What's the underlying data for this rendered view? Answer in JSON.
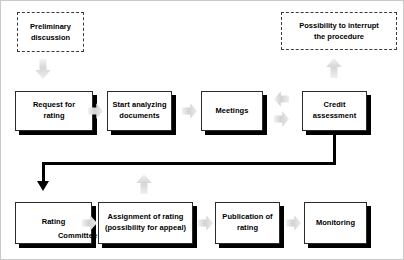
{
  "diagram": {
    "accent_color": "#000000",
    "arrow_color": "#d2d2d2",
    "nodes": [
      {
        "id": "preliminary-discussion",
        "label": "Preliminary discussion",
        "style": "dashed"
      },
      {
        "id": "possibility-to-interrupt",
        "label": "Possibility to interrupt the procedure",
        "style": "dashed"
      },
      {
        "id": "request-for-rating",
        "label": "Request for rating",
        "style": "solid"
      },
      {
        "id": "start-analyzing-documents",
        "label": "Start analyzing documents",
        "style": "solid"
      },
      {
        "id": "meetings",
        "label": "Meetings",
        "style": "solid"
      },
      {
        "id": "credit-assessment",
        "label": "Credit assessment",
        "style": "solid"
      },
      {
        "id": "rating-committee",
        "label": "Rating Committee",
        "style": "solid"
      },
      {
        "id": "assignment-of-rating",
        "label": "Assignment of rating (possibility for appeal)",
        "style": "solid"
      },
      {
        "id": "publication-of-rating",
        "label": "Publication of rating",
        "style": "solid"
      },
      {
        "id": "monitoring",
        "label": "Monitoring",
        "style": "solid"
      }
    ],
    "node_text": {
      "preliminary_discussion_line1": "Preliminary",
      "preliminary_discussion_line2": "discussion",
      "possibility_line1": "Possibility to interrupt",
      "possibility_line2": "the procedure",
      "request_line1": "Request for",
      "request_line2": "rating",
      "start_line1": "Start analyzing",
      "start_line2": "documents",
      "meetings_line1": "Meetings",
      "credit_line1": "Credit",
      "credit_line2": "assessment",
      "rating_committee_line1": "Rating",
      "rating_committee_line2": "Committee",
      "assignment_line1": "Assignment of rating",
      "assignment_line2": "(possibility for appeal)",
      "publication_line1": "Publication of",
      "publication_line2": "rating",
      "monitoring_line1": "Monitoring"
    },
    "connectors": [
      {
        "id": "preliminary-to-request",
        "icon": "arrow-down-icon",
        "direction": "down"
      },
      {
        "id": "request-to-start",
        "icon": "arrow-right-icon",
        "direction": "right"
      },
      {
        "id": "start-to-meetings",
        "icon": "arrow-right-icon",
        "direction": "right"
      },
      {
        "id": "meetings-to-credit",
        "icon": "arrow-right-icon",
        "direction": "right"
      },
      {
        "id": "credit-to-meetings",
        "icon": "arrow-left-icon",
        "direction": "left"
      },
      {
        "id": "credit-to-possibility",
        "icon": "arrow-up-icon",
        "direction": "up"
      },
      {
        "id": "assignment-to-credit-feedback",
        "icon": "arrow-up-icon",
        "direction": "up"
      },
      {
        "id": "credit-to-rating-committee",
        "icon": "elbow-connector-icon",
        "direction": "down-left"
      },
      {
        "id": "rating-committee-to-assignment",
        "icon": "arrow-right-icon",
        "direction": "right"
      },
      {
        "id": "assignment-to-publication",
        "icon": "arrow-right-icon",
        "direction": "right"
      },
      {
        "id": "publication-to-monitoring",
        "icon": "arrow-right-icon",
        "direction": "right"
      }
    ]
  }
}
